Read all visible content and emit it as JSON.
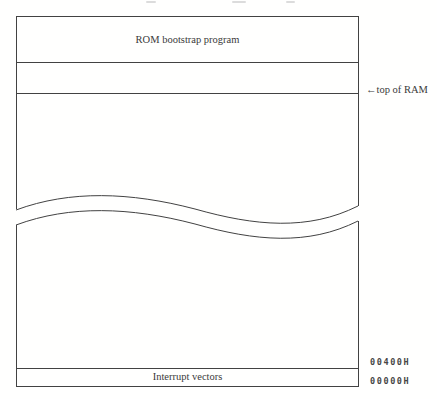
{
  "memory_map": {
    "rom_region_label": "ROM bootstrap program",
    "top_of_ram_label": "←top of RAM",
    "interrupt_vectors_label": "Interrupt vectors",
    "addresses": [
      {
        "value": "00400H"
      },
      {
        "value": "00000H"
      }
    ],
    "colors": {
      "line": "#424242",
      "text": "#3a3a3a",
      "hex_text": "#464646",
      "background": "#fffffe"
    }
  }
}
